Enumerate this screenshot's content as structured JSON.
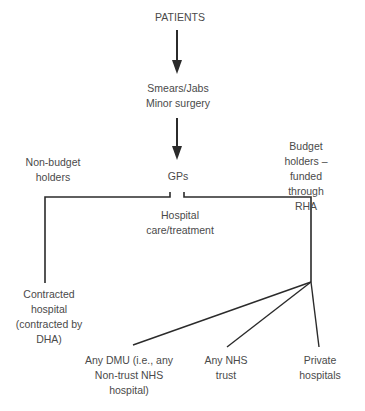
{
  "diagram": {
    "nodes": {
      "patients": "PATIENTS",
      "smears": "Smears/Jabs\nMinor surgery",
      "gps": "GPs",
      "non_budget": "Non-budget\nholders",
      "budget": "Budget holders –\nfunded through\nRHA",
      "hospital_care": "Hospital\ncare/treatment",
      "contracted": "Contracted\nhospital\n(contracted by\nDHA)",
      "dmu": "Any DMU (i.e., any\nNon-trust NHS\nhospital)",
      "nhs_trust": "Any NHS\ntrust",
      "private": "Private\nhospitals"
    },
    "edges": [
      {
        "from": "PATIENTS",
        "to": "Smears/Jabs Minor surgery",
        "type": "arrow"
      },
      {
        "from": "Smears/Jabs Minor surgery",
        "to": "GPs",
        "type": "arrow"
      },
      {
        "from": "GPs",
        "to": "Contracted hospital (contracted by DHA)",
        "type": "line",
        "via": "Non-budget holders"
      },
      {
        "from": "GPs",
        "to": "Any DMU (i.e., any Non-trust NHS hospital)",
        "type": "line",
        "via": "Budget holders – funded through RHA"
      },
      {
        "from": "GPs",
        "to": "Any NHS trust",
        "type": "line",
        "via": "Budget holders – funded through RHA"
      },
      {
        "from": "GPs",
        "to": "Private hospitals",
        "type": "line",
        "via": "Budget holders – funded through RHA"
      }
    ],
    "line_color": "#2b2b2b"
  }
}
